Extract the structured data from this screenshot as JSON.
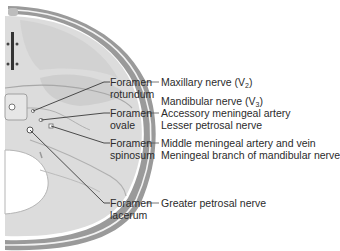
{
  "figure": {
    "colors": {
      "bone_fill": "#d9d9d9",
      "bone_shadow": "#bdbdbd",
      "skull_rim": "#8a8a8a",
      "leader_line": "#3a3a3a",
      "text": "#2b2b2b"
    }
  },
  "foramina": [
    {
      "name_line1": "Foramen",
      "name_line2": "rotundum",
      "contents": [
        {
          "text": "Maxillary nerve (V",
          "sub": "2",
          "tail": ")"
        }
      ]
    },
    {
      "name_line1": "Foramen",
      "name_line2": "ovale",
      "contents": [
        {
          "text": "Mandibular nerve (V",
          "sub": "3",
          "tail": ")"
        },
        {
          "text": "Accessory meningeal artery",
          "sub": "",
          "tail": ""
        },
        {
          "text": "Lesser petrosal nerve",
          "sub": "",
          "tail": ""
        }
      ]
    },
    {
      "name_line1": "Foramen",
      "name_line2": "spinosum",
      "contents": [
        {
          "text": "Middle meningeal artery and vein",
          "sub": "",
          "tail": ""
        },
        {
          "text": "Meningeal branch of mandibular nerve",
          "sub": "",
          "tail": ""
        }
      ]
    },
    {
      "name_line1": "Foramen",
      "name_line2": "lacerum",
      "contents": [
        {
          "text": "Greater petrosal nerve",
          "sub": "",
          "tail": ""
        }
      ]
    }
  ]
}
